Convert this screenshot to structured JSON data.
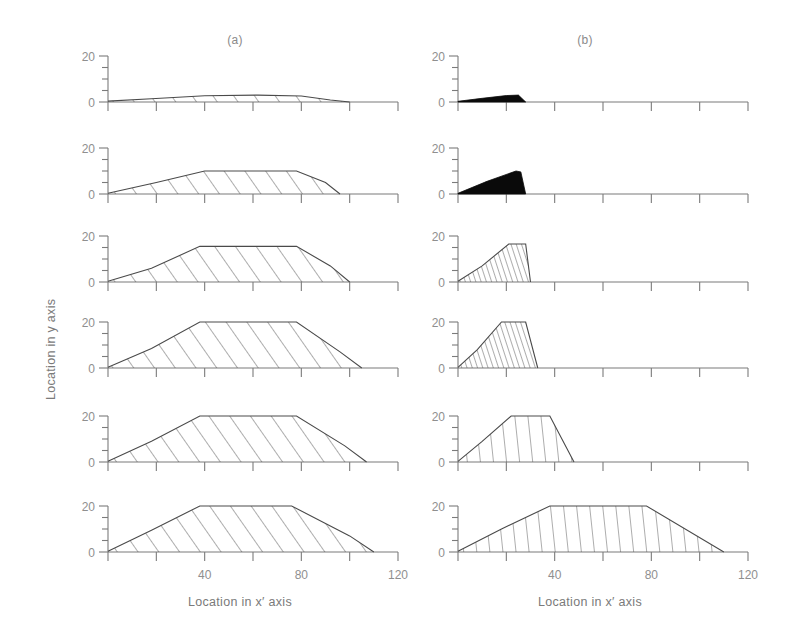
{
  "figure": {
    "panels": [
      {
        "key": "a",
        "title": "(a)"
      },
      {
        "key": "b",
        "title": "(b)"
      }
    ],
    "axes": {
      "xlabel": "Location in  x′  axis",
      "ylabel": "Location in  y  axis",
      "x_min": 0,
      "x_max": 120,
      "x_tick_step": 20,
      "x_ticks": [
        0,
        20,
        40,
        60,
        80,
        100,
        120
      ],
      "x_tick_labels": [
        "",
        "",
        "40",
        "",
        "80",
        "",
        "120"
      ],
      "y_min": 0,
      "y_max": 20,
      "y_tick_step": 5,
      "y_ticks": [
        0,
        5,
        10,
        15,
        20
      ],
      "y_tick_labels": [
        "0",
        "",
        "",
        "",
        "20"
      ],
      "grid": false
    },
    "rows": 6,
    "ink": {
      "axis": "#7b7b7b",
      "tick_label": "#8f8f8f",
      "profile": "#4a4a4a",
      "dense_fill": "#0a0a0a",
      "title": "#8a8a8a"
    }
  },
  "chart_data": {
    "type": "area",
    "title": "",
    "xlabel": "Location in  x′  axis",
    "ylabel": "Location in  y  axis",
    "xlim": [
      0,
      120
    ],
    "ylim": [
      0,
      20
    ],
    "grid": false,
    "panels": [
      {
        "name": "(a)",
        "profiles": [
          {
            "row": 1,
            "hatch": "diagonal",
            "fill": "hatched",
            "peak_height": 3.0,
            "points": [
              [
                0,
                0.4
              ],
              [
                18,
                1.4
              ],
              [
                40,
                2.7
              ],
              [
                62,
                3.0
              ],
              [
                80,
                2.6
              ],
              [
                92,
                0.9
              ],
              [
                100,
                0.0
              ]
            ]
          },
          {
            "row": 2,
            "hatch": "diagonal",
            "fill": "hatched",
            "peak_height": 10.0,
            "points": [
              [
                0,
                0.3
              ],
              [
                20,
                5.0
              ],
              [
                40,
                10.0
              ],
              [
                78,
                10.0
              ],
              [
                90,
                5.0
              ],
              [
                96,
                0.0
              ]
            ]
          },
          {
            "row": 3,
            "hatch": "diagonal",
            "fill": "hatched",
            "peak_height": 15.5,
            "points": [
              [
                0,
                0.3
              ],
              [
                18,
                6.0
              ],
              [
                38,
                15.5
              ],
              [
                78,
                15.5
              ],
              [
                92,
                7.0
              ],
              [
                100,
                0.0
              ]
            ]
          },
          {
            "row": 4,
            "hatch": "diagonal",
            "fill": "hatched",
            "peak_height": 20.0,
            "points": [
              [
                0,
                0.3
              ],
              [
                18,
                8.5
              ],
              [
                38,
                20.0
              ],
              [
                78,
                20.0
              ],
              [
                96,
                7.0
              ],
              [
                105,
                0.0
              ]
            ]
          },
          {
            "row": 5,
            "hatch": "diagonal",
            "fill": "hatched",
            "peak_height": 20.0,
            "points": [
              [
                0,
                0.3
              ],
              [
                18,
                9.0
              ],
              [
                38,
                20.0
              ],
              [
                78,
                20.0
              ],
              [
                98,
                7.0
              ],
              [
                107,
                0.0
              ]
            ]
          },
          {
            "row": 6,
            "hatch": "diagonal",
            "fill": "hatched",
            "peak_height": 20.0,
            "points": [
              [
                0,
                0.3
              ],
              [
                18,
                9.5
              ],
              [
                38,
                20.0
              ],
              [
                76,
                20.0
              ],
              [
                100,
                7.0
              ],
              [
                110,
                0.0
              ]
            ]
          }
        ]
      },
      {
        "name": "(b)",
        "profiles": [
          {
            "row": 1,
            "hatch": "dense",
            "fill": "solid",
            "peak_height": 3.0,
            "points": [
              [
                0,
                0.3
              ],
              [
                10,
                1.6
              ],
              [
                20,
                2.8
              ],
              [
                25,
                3.0
              ],
              [
                28,
                0.0
              ]
            ]
          },
          {
            "row": 2,
            "hatch": "dense",
            "fill": "solid",
            "peak_height": 10.0,
            "points": [
              [
                0,
                0.3
              ],
              [
                12,
                5.5
              ],
              [
                24,
                10.0
              ],
              [
                26,
                9.6
              ],
              [
                28,
                0.0
              ]
            ]
          },
          {
            "row": 3,
            "hatch": "steep",
            "fill": "hatched",
            "peak_height": 16.5,
            "points": [
              [
                0,
                0.3
              ],
              [
                10,
                7.0
              ],
              [
                21,
                16.5
              ],
              [
                28,
                16.5
              ],
              [
                30,
                0.0
              ]
            ]
          },
          {
            "row": 4,
            "hatch": "steep",
            "fill": "hatched",
            "peak_height": 20.0,
            "points": [
              [
                0,
                0.3
              ],
              [
                8,
                8.0
              ],
              [
                18,
                20.0
              ],
              [
                28,
                20.0
              ],
              [
                33,
                0.0
              ]
            ]
          },
          {
            "row": 5,
            "hatch": "vertical",
            "fill": "hatched",
            "peak_height": 20.0,
            "points": [
              [
                0,
                0.3
              ],
              [
                10,
                9.0
              ],
              [
                22,
                20.0
              ],
              [
                38,
                20.0
              ],
              [
                48,
                0.0
              ]
            ]
          },
          {
            "row": 6,
            "hatch": "vertical",
            "fill": "hatched",
            "peak_height": 20.0,
            "points": [
              [
                0,
                0.3
              ],
              [
                18,
                10.0
              ],
              [
                38,
                20.0
              ],
              [
                78,
                20.0
              ],
              [
                110,
                0.0
              ]
            ]
          }
        ]
      }
    ]
  }
}
